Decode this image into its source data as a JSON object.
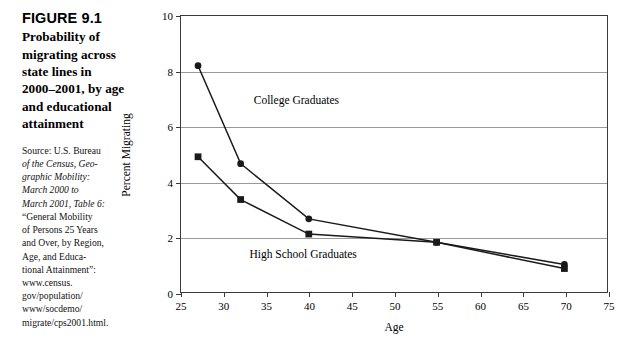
{
  "figure": {
    "number": "FIGURE 9.1",
    "title": "Probability of migrating across state lines in 2000–2001, by age and educational attainment",
    "source_lines": [
      "Source: U.S. Bureau",
      "of the Census, Geo-",
      "graphic Mobility:",
      "March 2000 to",
      "March 2001, Table 6:",
      "“General Mobility",
      "of Persons 25 Years",
      "and Over, by Region,",
      "Age, and Educa-",
      "tional Attainment”:",
      "www.census.",
      "gov/population/",
      "www/socdemo/",
      "migrate/cps2001.html."
    ]
  },
  "chart_data": {
    "type": "line",
    "title": "",
    "xlabel": "Age",
    "ylabel": "Percent Migrating",
    "xlim": [
      25,
      75
    ],
    "ylim": [
      0,
      10
    ],
    "xticks": [
      25,
      30,
      35,
      40,
      45,
      50,
      55,
      60,
      65,
      70,
      75
    ],
    "yticks": [
      0,
      2,
      4,
      6,
      8,
      10
    ],
    "grid": "horizontal",
    "legend_position": "inline-annotations",
    "series": [
      {
        "name": "College Graduates",
        "marker": "circle",
        "color": "#1a1a1a",
        "x": [
          27,
          32,
          40,
          55,
          70
        ],
        "values": [
          8.2,
          4.65,
          2.65,
          1.8,
          1.0
        ],
        "annotation": {
          "text": "College Graduates",
          "x": 33.5,
          "y": 6.9
        }
      },
      {
        "name": "High School Graduates",
        "marker": "square",
        "color": "#1a1a1a",
        "x": [
          27,
          32,
          40,
          55,
          70
        ],
        "values": [
          4.9,
          3.35,
          2.1,
          1.8,
          0.85
        ],
        "annotation": {
          "text": "High School Graduates",
          "x": 33.0,
          "y": 1.35
        }
      }
    ]
  }
}
